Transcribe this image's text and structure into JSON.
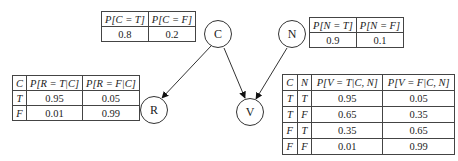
{
  "nodes": {
    "c": {
      "label": "C"
    },
    "n": {
      "label": "N"
    },
    "r": {
      "label": "R"
    },
    "v": {
      "label": "V"
    }
  },
  "edges": [
    {
      "from": "C",
      "to": "R"
    },
    {
      "from": "C",
      "to": "V"
    },
    {
      "from": "N",
      "to": "V"
    }
  ],
  "tables": {
    "c": {
      "headers": [
        "P[C = T]",
        "P[C = F]"
      ],
      "rows": [
        [
          "0.8",
          "0.2"
        ]
      ]
    },
    "n": {
      "headers": [
        "P[N = T]",
        "P[N = F]"
      ],
      "rows": [
        [
          "0.9",
          "0.1"
        ]
      ]
    },
    "r": {
      "headers": [
        "C",
        "P[R = T|C]",
        "P[R = F|C]"
      ],
      "rows": [
        [
          "T",
          "0.95",
          "0.05"
        ],
        [
          "F",
          "0.01",
          "0.99"
        ]
      ]
    },
    "v": {
      "headers": [
        "C",
        "N",
        "P[V = T|C, N]",
        "P[V = F|C, N]"
      ],
      "rows": [
        [
          "T",
          "T",
          "0.95",
          "0.05"
        ],
        [
          "T",
          "F",
          "0.65",
          "0.35"
        ],
        [
          "F",
          "T",
          "0.35",
          "0.65"
        ],
        [
          "F",
          "F",
          "0.01",
          "0.99"
        ]
      ]
    }
  }
}
